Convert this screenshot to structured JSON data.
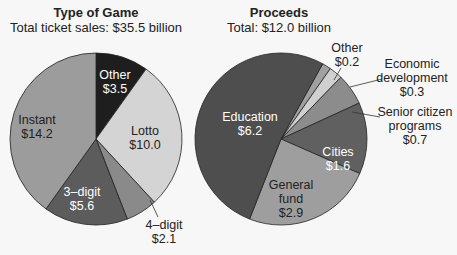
{
  "chart_data": [
    {
      "type": "pie",
      "title": "Type of Game",
      "subtitle": "Total ticket sales: $35.5 billion",
      "unit": "billion USD",
      "categories": [
        "Other",
        "Lotto",
        "4-digit",
        "3-digit",
        "Instant"
      ],
      "values": [
        3.5,
        10.0,
        2.1,
        5.6,
        14.2
      ],
      "labels": [
        "$3.5",
        "$10.0",
        "$2.1",
        "$5.6",
        "$14.2"
      ],
      "colors": [
        "#1e1e1e",
        "#d4d4d4",
        "#8a8a8a",
        "#5c5c5c",
        "#9c9c9c"
      ],
      "start_angle": "12 o'clock, clockwise"
    },
    {
      "type": "pie",
      "title": "Proceeds",
      "subtitle": "Total: $12.0 billion",
      "unit": "billion USD",
      "categories": [
        "Other",
        "Economic development",
        "Senior citizen programs",
        "Cities",
        "General fund",
        "Education"
      ],
      "values": [
        0.2,
        0.3,
        0.7,
        1.6,
        2.9,
        6.2
      ],
      "labels": [
        "$0.2",
        "$0.3",
        "$0.7",
        "$1.6",
        "$2.9",
        "$6.2"
      ],
      "colors": [
        "#a0a0a0",
        "#d0d0d0",
        "#8c8c8c",
        "#606060",
        "#9e9e9e",
        "#4e4e4e"
      ]
    }
  ],
  "left": {
    "title": "Type of Game",
    "subtitle": "Total ticket sales: $35.5 billion",
    "labels": {
      "other": {
        "name": "Other",
        "value": "$3.5"
      },
      "lotto": {
        "name": "Lotto",
        "value": "$10.0"
      },
      "four": {
        "name": "4–digit",
        "value": "$2.1"
      },
      "three": {
        "name": "3–digit",
        "value": "$5.6"
      },
      "instant": {
        "name": "Instant",
        "value": "$14.2"
      }
    }
  },
  "right": {
    "title": "Proceeds",
    "subtitle": "Total: $12.0 billion",
    "labels": {
      "other": {
        "name": "Other",
        "value": "$0.2"
      },
      "econ": {
        "line1": "Economic",
        "line2": "development",
        "value": "$0.3"
      },
      "senior": {
        "line1": "Senior citizen",
        "line2": "programs",
        "value": "$0.7"
      },
      "cities": {
        "name": "Cities",
        "value": "$1.6"
      },
      "general": {
        "line1": "General",
        "line2": "fund",
        "value": "$2.9"
      },
      "education": {
        "name": "Education",
        "value": "$6.2"
      }
    }
  }
}
